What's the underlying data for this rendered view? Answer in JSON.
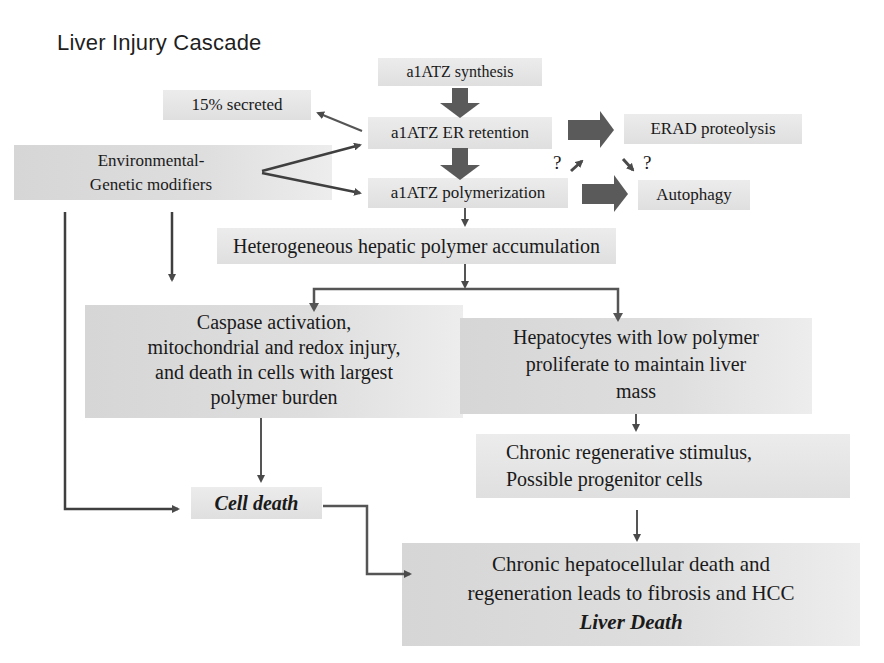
{
  "title": "Liver Injury Cascade",
  "nodes": {
    "synthesis": "a1ATZ synthesis",
    "secreted": "15% secreted",
    "er_retention": "a1ATZ ER retention",
    "erad": "ERAD proteolysis",
    "modifiers": [
      "Environmental-",
      "Genetic modifiers"
    ],
    "polymerization": "a1ATZ polymerization",
    "autophagy": "Autophagy",
    "question_left": "?",
    "question_right": "?",
    "accumulation": "Heterogeneous hepatic polymer accumulation",
    "caspase": [
      "Caspase activation,",
      "mitochondrial and redox injury,",
      "and death in cells with largest",
      "polymer burden"
    ],
    "hepatocytes": [
      "Hepatocytes with low polymer",
      "proliferate to maintain liver",
      "mass"
    ],
    "cell_death": "Cell death",
    "regenerative": [
      "Chronic regenerative stimulus,",
      "Possible progenitor cells"
    ],
    "chronic": [
      "Chronic hepatocellular death and",
      "regeneration leads to fibrosis and HCC"
    ],
    "liver_death": "Liver Death"
  },
  "colors": {
    "box_fill": "#dcdcdc",
    "arrow_dark": "#4a4a4a",
    "block_arrow": "#5a5a5a",
    "text": "#1a1a1a"
  }
}
